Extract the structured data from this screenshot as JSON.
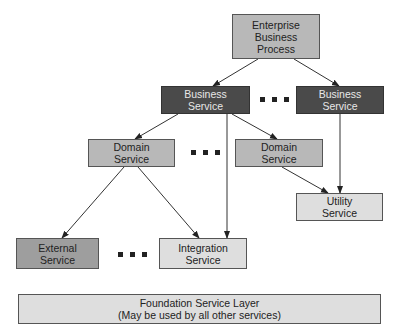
{
  "diagram": {
    "nodes": {
      "enterprise": {
        "lines": [
          "Enterprise",
          "Business",
          "Process"
        ]
      },
      "business_left": {
        "lines": [
          "Business",
          "Service"
        ]
      },
      "business_right": {
        "lines": [
          "Business",
          "Service"
        ]
      },
      "domain_left": {
        "lines": [
          "Domain",
          "Service"
        ]
      },
      "domain_right": {
        "lines": [
          "Domain",
          "Service"
        ]
      },
      "utility": {
        "lines": [
          "Utility",
          "Service"
        ]
      },
      "external": {
        "lines": [
          "External",
          "Service"
        ]
      },
      "integration": {
        "lines": [
          "Integration",
          "Service"
        ]
      },
      "foundation": {
        "lines": [
          "Foundation Service Layer",
          "(May be used by all other services)"
        ]
      }
    },
    "edges": [
      {
        "from": "enterprise",
        "to": "business_left"
      },
      {
        "from": "enterprise",
        "to": "business_right"
      },
      {
        "from": "business_left",
        "to": "domain_left"
      },
      {
        "from": "business_left",
        "to": "domain_right"
      },
      {
        "from": "business_left",
        "to": "integration"
      },
      {
        "from": "business_right",
        "to": "utility"
      },
      {
        "from": "domain_right",
        "to": "utility"
      },
      {
        "from": "domain_left",
        "to": "external"
      },
      {
        "from": "domain_left",
        "to": "integration"
      }
    ],
    "ellipses": [
      "between business services",
      "between domain services",
      "between external and integration services"
    ]
  }
}
